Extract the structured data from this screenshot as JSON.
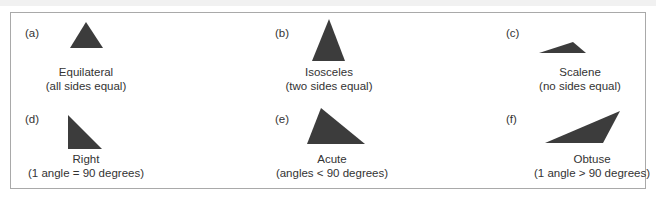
{
  "figure": {
    "panels": [
      {
        "tag": "(a)",
        "name": "Equilateral",
        "desc": "(all sides equal)"
      },
      {
        "tag": "(b)",
        "name": "Isosceles",
        "desc": "(two sides equal)"
      },
      {
        "tag": "(c)",
        "name": "Scalene",
        "desc": "(no sides equal)"
      },
      {
        "tag": "(d)",
        "name": "Right",
        "desc": "(1 angle = 90 degrees)"
      },
      {
        "tag": "(e)",
        "name": "Acute",
        "desc": "(angles < 90 degrees)"
      },
      {
        "tag": "(f)",
        "name": "Obtuse",
        "desc": "(1 angle > 90 degrees)"
      }
    ],
    "colors": {
      "triangle": "#3c3c3c",
      "border": "#a9a9a9"
    }
  }
}
